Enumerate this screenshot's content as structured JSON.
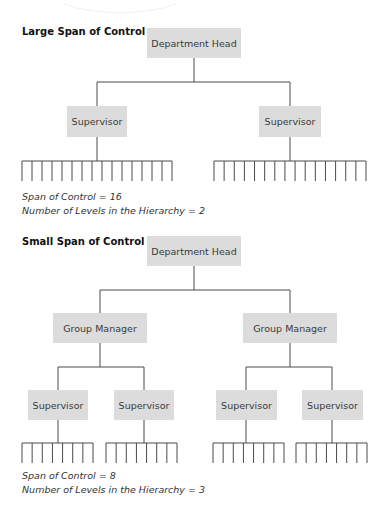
{
  "large": {
    "title": "Large Span of Control",
    "head": "Department Head",
    "supervisors": [
      "Supervisor",
      "Supervisor"
    ],
    "span_text": "Span of Control = 16",
    "levels_text": "Number of Levels in the Hierarchy = 2",
    "span": 16,
    "levels": 2
  },
  "small": {
    "title": "Small Span of Control",
    "head": "Department Head",
    "group_managers": [
      "Group Manager",
      "Group Manager"
    ],
    "supervisors": [
      "Supervisor",
      "Supervisor",
      "Supervisor",
      "Supervisor"
    ],
    "span_text": "Span of Control = 8",
    "levels_text": "Number of Levels in the Hierarchy = 3",
    "span": 8,
    "levels": 3
  },
  "colors": {
    "box_fill": "#dcdcdc",
    "line": "#4a4a4a"
  }
}
